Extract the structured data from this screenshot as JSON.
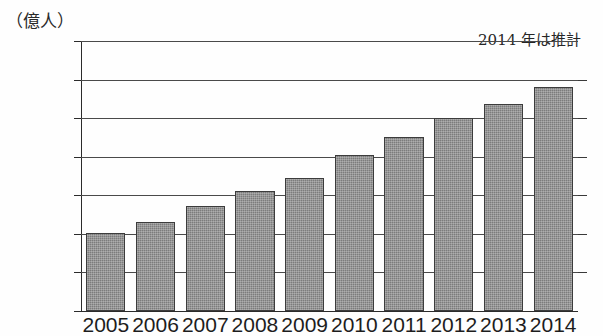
{
  "chart_data": {
    "type": "bar",
    "title": "",
    "subtitle": "",
    "unit_label": "（億人）",
    "annotation": "2014 年は推計",
    "xlabel": "",
    "ylabel": "",
    "ylim": [
      0,
      35
    ],
    "ytick_step": 5,
    "yticks": [
      "0",
      "5",
      "10",
      "15",
      "20",
      "25",
      "30",
      "35"
    ],
    "grid": true,
    "legend": "none",
    "categories": [
      "2005",
      "2006",
      "2007",
      "2008",
      "2009",
      "2010",
      "2011",
      "2012",
      "2013",
      "2014"
    ],
    "values": [
      10.1,
      11.5,
      13.6,
      15.5,
      17.3,
      20.2,
      22.6,
      25.0,
      26.9,
      29.0
    ],
    "series": [
      {
        "name": "",
        "values": [
          10.1,
          11.5,
          13.6,
          15.5,
          17.3,
          20.2,
          22.6,
          25.0,
          26.9,
          29.0
        ]
      }
    ],
    "bar_color": "#7c7c7c",
    "bar_edge_color": "#3c3c3c",
    "axis_color": "#2b2b2b",
    "background_color": "#fefefe"
  }
}
